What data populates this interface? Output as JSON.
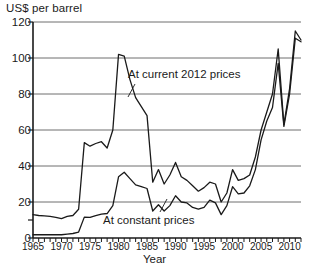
{
  "chart_data": {
    "type": "line",
    "title": "",
    "ylabel": "US$ per barrel",
    "xlabel": "Year",
    "ylim": [
      0,
      120
    ],
    "xlim": [
      1965,
      2012
    ],
    "yticks": [
      0,
      20,
      40,
      60,
      80,
      100,
      120
    ],
    "ytick_labels": [
      "0",
      "20",
      "40",
      "60",
      "80",
      "100",
      "120"
    ],
    "xticks": [
      1965,
      1970,
      1975,
      1980,
      1985,
      1990,
      1995,
      2000,
      2005,
      2010
    ],
    "xtick_labels": [
      "1965",
      "1970",
      "1975",
      "1980",
      "1985",
      "1990",
      "1995",
      "2000",
      "2005",
      "2010"
    ],
    "xtick_minor_step": 1,
    "grid": "horizontal",
    "legend_position": "inline-annotations",
    "x": [
      1965,
      1966,
      1967,
      1968,
      1969,
      1970,
      1971,
      1972,
      1973,
      1974,
      1975,
      1976,
      1977,
      1978,
      1979,
      1980,
      1981,
      1982,
      1983,
      1984,
      1985,
      1986,
      1987,
      1988,
      1989,
      1990,
      1991,
      1992,
      1993,
      1994,
      1995,
      1996,
      1997,
      1998,
      1999,
      2000,
      2001,
      2002,
      2003,
      2004,
      2005,
      2006,
      2007,
      2008,
      2009,
      2010,
      2011,
      2012
    ],
    "series": [
      {
        "name": "At current 2012 prices",
        "label": "At current 2012 prices",
        "color": "#1a1a1a",
        "values": [
          13,
          12.5,
          12.3,
          12,
          11.5,
          10.8,
          12,
          12.5,
          16,
          53,
          51,
          52.5,
          53.5,
          50,
          60,
          102,
          101,
          88,
          78,
          73,
          68,
          31,
          38,
          30,
          35,
          42,
          34,
          32,
          29,
          26,
          28,
          31,
          30,
          20,
          25,
          38,
          32,
          33,
          35,
          45,
          60,
          70,
          80,
          105,
          63,
          83,
          115,
          110
        ]
      },
      {
        "name": "At constant prices",
        "label": "At constant prices",
        "color": "#1a1a1a",
        "values": [
          1.8,
          1.8,
          1.8,
          1.8,
          1.8,
          1.8,
          2.2,
          2.5,
          3.3,
          11.6,
          11.5,
          12.4,
          13.3,
          13.6,
          18,
          34,
          36.5,
          33,
          29.5,
          28.5,
          27.5,
          15,
          18.5,
          15,
          18,
          23.5,
          20,
          19.5,
          17,
          16,
          17,
          21,
          19.5,
          13,
          18,
          28.5,
          24.5,
          25,
          29,
          38,
          54.5,
          65,
          72.5,
          97,
          62,
          80,
          111,
          109
        ]
      }
    ],
    "annotations": [
      {
        "name": "current-prices-annotation",
        "text": "At current 2012 prices"
      },
      {
        "name": "constant-prices-annotation",
        "text": "At constant prices"
      }
    ]
  },
  "axes": {
    "y_title": "US$ per barrel",
    "x_title": "Year"
  },
  "colors": {
    "line": "#1a1a1a",
    "grid": "#6f6f6f",
    "axis": "#1a1a1a",
    "background": "#ffffff"
  }
}
